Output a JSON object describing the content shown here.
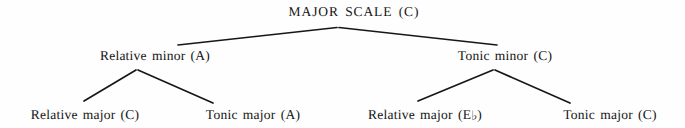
{
  "figure": {
    "title": "MAJOR SCALE (C)",
    "type": "tree-diagram",
    "background_color": "#fefefe",
    "line_color": "#171717",
    "text_color": "#151515"
  },
  "tree": {
    "root": {
      "id": "major-scale",
      "label": "MAJOR SCALE (C)",
      "x": 354,
      "y": 12
    },
    "level2": [
      {
        "id": "relative-minor",
        "label": "Relative minor (A)",
        "x": 155,
        "y": 56
      },
      {
        "id": "tonic-minor",
        "label": "Tonic minor (C)",
        "x": 505,
        "y": 56
      }
    ],
    "level3": [
      {
        "id": "relative-major-c",
        "label": "Relative major (C)",
        "label_prefix": "Relative major (C)",
        "accidental": "",
        "label_suffix": "",
        "x": 85,
        "y": 115
      },
      {
        "id": "tonic-major-a",
        "label": "Tonic major (A)",
        "label_prefix": "Tonic major (A)",
        "accidental": "",
        "label_suffix": "",
        "x": 253,
        "y": 115
      },
      {
        "id": "relative-major-eb",
        "label": "Relative major (E♭)",
        "label_prefix": "Relative major (E",
        "accidental": "♭",
        "label_suffix": ")",
        "x": 425,
        "y": 115
      },
      {
        "id": "tonic-major-c",
        "label": "Tonic major (C)",
        "label_prefix": "Tonic major (C)",
        "accidental": "",
        "label_suffix": "",
        "x": 610,
        "y": 115
      }
    ],
    "edges": [
      {
        "id": "root-to-relative-minor",
        "x1": 337,
        "y1": 27,
        "x2": 178,
        "y2": 45
      },
      {
        "id": "root-to-tonic-minor",
        "x1": 339,
        "y1": 27,
        "x2": 497,
        "y2": 45
      },
      {
        "id": "relative-minor-to-relative-major-c",
        "x1": 136,
        "y1": 70,
        "x2": 84,
        "y2": 101
      },
      {
        "id": "relative-minor-to-tonic-major-a",
        "x1": 138,
        "y1": 70,
        "x2": 213,
        "y2": 103
      },
      {
        "id": "tonic-minor-to-relative-major-eb",
        "x1": 493,
        "y1": 70,
        "x2": 418,
        "y2": 101
      },
      {
        "id": "tonic-minor-to-tonic-major-c",
        "x1": 495,
        "y1": 70,
        "x2": 570,
        "y2": 103
      }
    ]
  }
}
